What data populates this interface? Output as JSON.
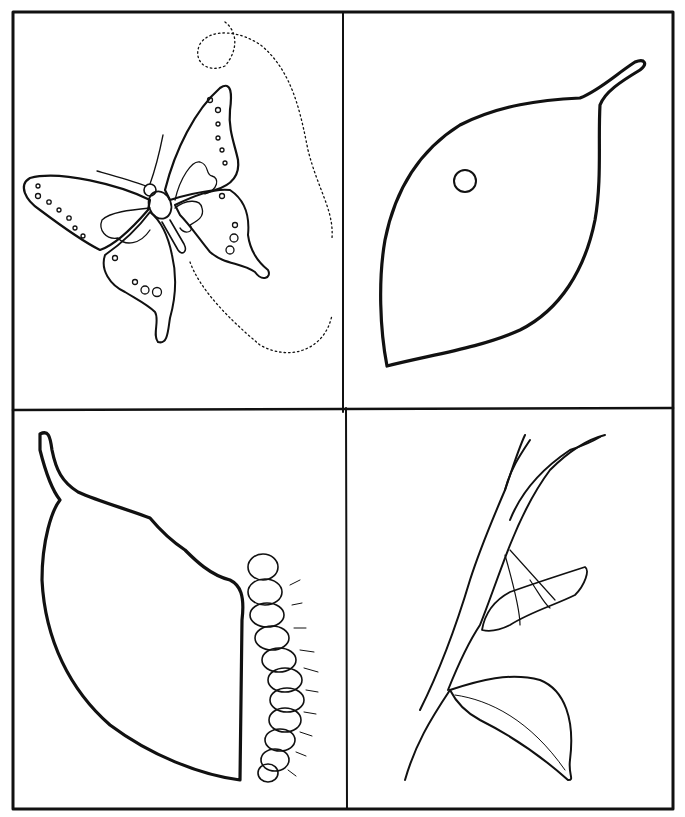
{
  "title": "",
  "panels": [
    {
      "id": "adult",
      "subject": "butterfly"
    },
    {
      "id": "egg",
      "subject": "egg on leaf"
    },
    {
      "id": "larva",
      "subject": "caterpillar eating leaf"
    },
    {
      "id": "pupa",
      "subject": "chrysalis on branch"
    }
  ],
  "colors": {
    "ink": "#111111",
    "paper": "#ffffff"
  }
}
